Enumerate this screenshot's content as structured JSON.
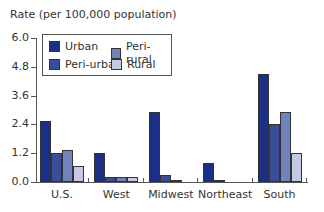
{
  "chart_data": {
    "type": "bar",
    "title": "",
    "ylabel": "Rate (per 100,000 population)",
    "xlabel": "",
    "ylim": [
      0,
      6.0
    ],
    "yticks": [
      "0.0",
      "1.2",
      "2.4",
      "3.6",
      "4.8",
      "6.0"
    ],
    "categories": [
      "U.S.",
      "West",
      "Midwest",
      "Northeast",
      "South"
    ],
    "series": [
      {
        "name": "Urban",
        "color": "#1c2f86",
        "values": [
          2.55,
          1.2,
          2.9,
          0.8,
          4.5
        ]
      },
      {
        "name": "Peri-urban",
        "color": "#3a4d99",
        "values": [
          1.2,
          0.2,
          0.3,
          0.1,
          2.4
        ]
      },
      {
        "name": "Peri-rural",
        "color": "#7183bd",
        "values": [
          1.35,
          0.2,
          0.1,
          0.0,
          2.9
        ]
      },
      {
        "name": "Rural",
        "color": "#c3cae6",
        "values": [
          0.65,
          0.2,
          0.0,
          0.0,
          1.2
        ]
      }
    ],
    "legend_position": "top-left",
    "grid": false
  },
  "legend": {
    "items": [
      {
        "label": "Urban"
      },
      {
        "label": "Peri-rural"
      },
      {
        "label": "Peri-urban"
      },
      {
        "label": "Rural"
      }
    ]
  }
}
